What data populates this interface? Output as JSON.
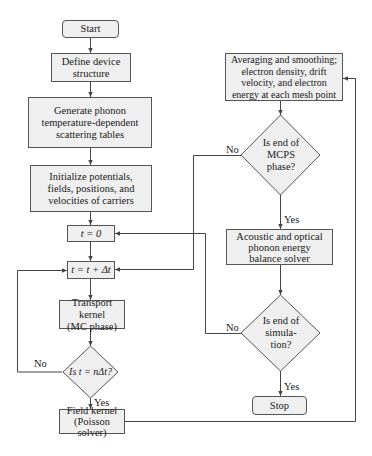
{
  "flowchart": {
    "nodes": {
      "start": "Start",
      "define": "Define device structure",
      "generate": "Generate phonon temperature-dependent scattering tables",
      "initialize": "Initialize potentials, fields, positions, and velocities of carriers",
      "t_zero": "t = 0",
      "t_step": "t = t + Δt",
      "transport": "Transport kernel (MC phase)",
      "decision_ndt": "Is t = nΔt?",
      "field": "Field kernel (Poisson solver)",
      "averaging": "Averaging and smoothing; electron density, drift velocity, and electron energy at each mesh point",
      "decision_mcps": "Is end of MCPS phase?",
      "acoustic": "Acoustic and optical phonon energy balance solver",
      "decision_sim": "Is end of simula-tion?",
      "stop": "Stop"
    },
    "lines": {
      "define_1": "Define device",
      "define_2": "structure",
      "generate_1": "Generate phonon",
      "generate_2": "temperature-dependent",
      "generate_3": "scattering tables",
      "init_1": "Initialize potentials,",
      "init_2": "fields, positions, and",
      "init_3": "velocities of carriers",
      "transport_1": "Transport kernel",
      "transport_2": "(MC phase)",
      "field_1": "Field kernel",
      "field_2": "(Poisson solver)",
      "avg_1": "Averaging and smoothing;",
      "avg_2": "electron density, drift",
      "avg_3": "velocity, and electron",
      "avg_4": "energy at each mesh point",
      "mcps_1": "Is end of",
      "mcps_2": "MCPS",
      "mcps_3": "phase?",
      "ac_1": "Acoustic and optical",
      "ac_2": "phonon energy",
      "ac_3": "balance solver",
      "sim_1": "Is end of",
      "sim_2": "simula-",
      "sim_3": "tion?"
    },
    "edge_labels": {
      "ndt_no": "No",
      "ndt_yes": "Yes",
      "mcps_no": "No",
      "mcps_yes": "Yes",
      "sim_no": "No",
      "sim_yes": "Yes"
    },
    "colors": {
      "box_fill": "#efefef",
      "stroke": "#555555",
      "line": "#444444"
    }
  }
}
